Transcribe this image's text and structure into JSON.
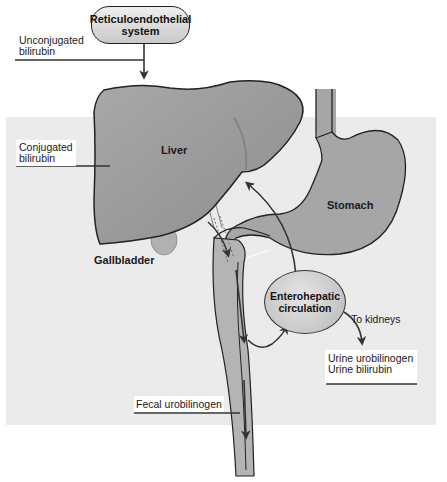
{
  "diagram": {
    "nodes": {
      "reticuloendothelial": {
        "line1": "Reticuloendothelial",
        "line2": "system"
      },
      "enterohepatic": {
        "line1": "Enterohepatic",
        "line2": "circulation"
      }
    },
    "organs": {
      "liver": "Liver",
      "stomach": "Stomach",
      "gallbladder": "Gallbladder"
    },
    "labels": {
      "unconjugated": {
        "line1": "Unconjugated",
        "line2": "bilirubin"
      },
      "conjugated": {
        "line1": "Conjugated",
        "line2": "bilirubin"
      },
      "to_kidneys": "To kidneys",
      "urine": {
        "line1": "Urine urobilinogen",
        "line2": "Urine bilirubin"
      },
      "fecal": "Fecal urobilinogen"
    },
    "colors": {
      "panel_bg": "#ebebeb",
      "organ_fill": "#9b9b9b",
      "stomach_fill": "#a6a6a6",
      "line": "#222222",
      "arrow": "#333333"
    }
  }
}
